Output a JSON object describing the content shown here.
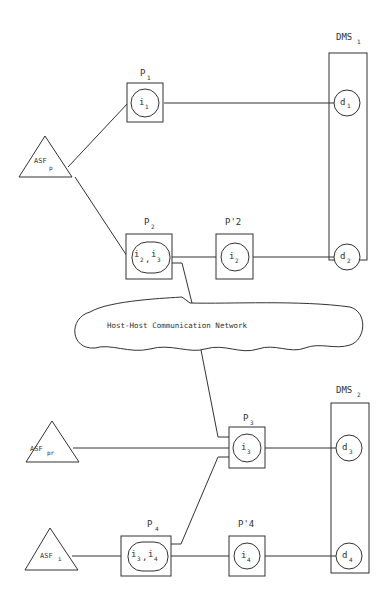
{
  "diagram": {
    "network": {
      "label": "Host-Host Communication Network"
    },
    "dms": [
      {
        "id": "DMS1",
        "name": "DMS",
        "sub": "1",
        "items": [
          {
            "name": "d",
            "sub": "1"
          },
          {
            "name": "d",
            "sub": "2"
          }
        ]
      },
      {
        "id": "DMS2",
        "name": "DMS",
        "sub": "2",
        "items": [
          {
            "name": "d",
            "sub": "3"
          },
          {
            "name": "d",
            "sub": "4"
          }
        ]
      }
    ],
    "asf": [
      {
        "id": "ASFp",
        "name": "ASF",
        "sub": "p"
      },
      {
        "id": "ASFpr",
        "name": "ASF",
        "sub": "pr"
      },
      {
        "id": "ASFi",
        "name": "ASF",
        "sub": "i"
      }
    ],
    "processes": [
      {
        "id": "P1",
        "name": "P",
        "sub": "1",
        "content": "i",
        "content_sub": "1"
      },
      {
        "id": "P2",
        "name": "P",
        "sub": "2",
        "content": "i2,i3",
        "content_parts": [
          {
            "t": "i",
            "s": "2"
          },
          {
            "t": "i",
            "s": "3"
          }
        ]
      },
      {
        "id": "P'2",
        "name": "P'2",
        "content": "i",
        "content_sub": "2"
      },
      {
        "id": "P3",
        "name": "P",
        "sub": "3",
        "content": "i",
        "content_sub": "3"
      },
      {
        "id": "P4",
        "name": "P",
        "sub": "4",
        "content": "i3,i4",
        "content_parts": [
          {
            "t": "i",
            "s": "3"
          },
          {
            "t": "i",
            "s": "4"
          }
        ]
      },
      {
        "id": "P'4",
        "name": "P'4",
        "content": "i",
        "content_sub": "4"
      }
    ],
    "connections": [
      [
        "ASFp",
        "P1"
      ],
      [
        "ASFp",
        "P2"
      ],
      [
        "P1",
        "DMS1.d1"
      ],
      [
        "P2",
        "P'2"
      ],
      [
        "P'2",
        "DMS1.d2"
      ],
      [
        "P2",
        "P3 (via network, dashed)"
      ],
      [
        "ASFpr",
        "P3"
      ],
      [
        "P3",
        "DMS2.d3"
      ],
      [
        "ASFi",
        "P4"
      ],
      [
        "P4",
        "P3"
      ],
      [
        "P4",
        "P'4"
      ],
      [
        "P'4",
        "DMS2.d4"
      ]
    ],
    "colors": {
      "line": "#333333",
      "background": "#ffffff"
    }
  }
}
